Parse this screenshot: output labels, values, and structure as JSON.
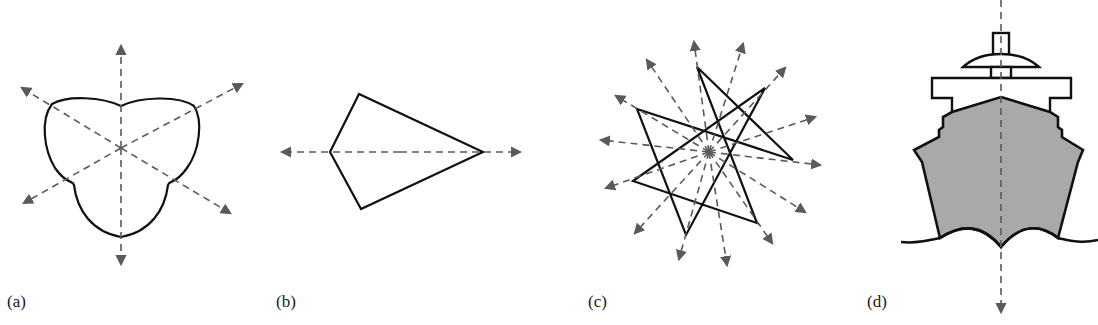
{
  "figure": {
    "panels": [
      {
        "id": "a",
        "label": "(a)",
        "shape": "three-lobed trefoil",
        "axes_of_symmetry": 3
      },
      {
        "id": "b",
        "label": "(b)",
        "shape": "kite",
        "axes_of_symmetry": 1
      },
      {
        "id": "c",
        "label": "(c)",
        "shape": "seven-pointed star",
        "axes_of_symmetry": 7
      },
      {
        "id": "d",
        "label": "(d)",
        "shape": "ship front view",
        "axes_of_symmetry": 1
      }
    ]
  },
  "colors": {
    "outline": "#111111",
    "axis": "#5a5a5a",
    "hull_fill": "#a9a9a9",
    "background": "#ffffff"
  }
}
